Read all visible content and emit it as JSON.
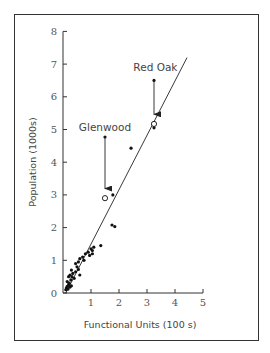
{
  "chart_data": {
    "type": "scatter",
    "title": "",
    "xlabel": "Functional Units (100 s)",
    "ylabel": "Population (1000s)",
    "xlim": [
      0,
      5
    ],
    "ylim": [
      0,
      8
    ],
    "xticks": [
      1,
      2,
      3,
      4,
      5
    ],
    "yticks": [
      0,
      1,
      2,
      3,
      4,
      5,
      6,
      7,
      8
    ],
    "grid": false,
    "legend": null,
    "series": [
      {
        "name": "Settlements",
        "marker": "filled-dot",
        "points": [
          [
            0.1,
            0.1
          ],
          [
            0.12,
            0.15
          ],
          [
            0.15,
            0.2
          ],
          [
            0.18,
            0.12
          ],
          [
            0.2,
            0.25
          ],
          [
            0.22,
            0.3
          ],
          [
            0.25,
            0.18
          ],
          [
            0.15,
            0.35
          ],
          [
            0.28,
            0.4
          ],
          [
            0.3,
            0.22
          ],
          [
            0.2,
            0.5
          ],
          [
            0.25,
            0.55
          ],
          [
            0.32,
            0.5
          ],
          [
            0.35,
            0.6
          ],
          [
            0.3,
            0.7
          ],
          [
            0.4,
            0.45
          ],
          [
            0.45,
            0.65
          ],
          [
            0.5,
            0.8
          ],
          [
            0.55,
            0.72
          ],
          [
            0.6,
            0.55
          ],
          [
            0.45,
            0.9
          ],
          [
            0.55,
            0.95
          ],
          [
            0.6,
            1.05
          ],
          [
            0.7,
            1.1
          ],
          [
            0.75,
            1.0
          ],
          [
            0.8,
            1.2
          ],
          [
            0.9,
            1.25
          ],
          [
            1.0,
            1.35
          ],
          [
            1.05,
            1.3
          ],
          [
            0.95,
            1.15
          ],
          [
            1.1,
            1.4
          ],
          [
            1.05,
            1.2
          ],
          [
            1.35,
            1.45
          ],
          [
            1.75,
            2.08
          ],
          [
            1.85,
            2.03
          ],
          [
            1.78,
            3.0
          ],
          [
            2.43,
            4.43
          ],
          [
            3.25,
            5.05
          ]
        ]
      },
      {
        "name": "Observed (arrow origin)",
        "marker": "filled-dot",
        "points": [
          [
            1.5,
            4.77
          ],
          [
            3.25,
            6.5
          ]
        ]
      },
      {
        "name": "Predicted (open circle)",
        "marker": "open-circle",
        "points": [
          [
            1.5,
            2.9
          ],
          [
            3.25,
            5.17
          ]
        ]
      }
    ],
    "regression_line": {
      "from": [
        0.1,
        0.0
      ],
      "to": [
        4.43,
        7.2
      ]
    },
    "annotations": [
      {
        "text": "Glenwood",
        "at": [
          1.5,
          4.95
        ],
        "arrow_from": [
          1.5,
          4.77
        ],
        "arrow_to": [
          1.5,
          2.95
        ]
      },
      {
        "text": "Red Oak",
        "at": [
          3.3,
          6.8
        ],
        "arrow_from": [
          3.25,
          6.5
        ],
        "arrow_to": [
          3.25,
          5.22
        ]
      }
    ]
  }
}
